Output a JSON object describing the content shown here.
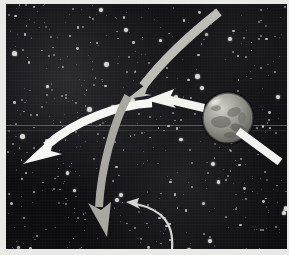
{
  "figure": {
    "kind": "astrophotograph-diagram",
    "caption_text": "",
    "background": {
      "sky_color": "#0d0d10",
      "plate_border_color": "#e9e9e6",
      "scanline_color": "#bebebe"
    },
    "planet": {
      "name": "planet-disc",
      "label": "",
      "center_x": 222,
      "center_y": 114,
      "radius": 25,
      "body_color": "#8e8e88",
      "highlight_color": "#d8d8d2",
      "shadow_color": "#4a4a46",
      "polar_cap_color": "#e2e2dc"
    },
    "annotations": [
      {
        "id": "arrow-incoming-top-right",
        "name": "arrow-curved-descending",
        "label": "",
        "color": "#bdbdb6",
        "style": "thick-curved",
        "head": "down-left",
        "from": "top-right-edge",
        "to": "center-upper"
      },
      {
        "id": "arrow-incoming-from-planet",
        "name": "arrow-pointing-left",
        "label": "",
        "color": "#f2f2ee",
        "style": "thick-straight",
        "head": "left",
        "from": "planet-left-limb",
        "to": "center"
      },
      {
        "id": "arrow-outgoing-left",
        "name": "arrow-curved-to-left-edge",
        "label": "",
        "color": "#f6f6f2",
        "style": "thick-curved",
        "head": "down-left",
        "from": "center",
        "to": "left-edge"
      },
      {
        "id": "arrow-outgoing-down",
        "name": "arrow-curved-descending-to-bottom",
        "label": "",
        "color": "#a8a8a1",
        "style": "thick-curved",
        "head": "down",
        "from": "center",
        "to": "bottom-center"
      },
      {
        "id": "arrow-trailing-right",
        "name": "arrow-band-from-planet-lower-right",
        "label": "",
        "color": "#f2f2ee",
        "style": "thick-straight-tapered",
        "head": "none",
        "from": "planet",
        "to": "right-edge-lower"
      },
      {
        "id": "pointer-thin",
        "name": "thin-pointer-arrow",
        "label": "",
        "color": "#d6d6d0",
        "style": "thin-curved",
        "head": "up-left",
        "from": "bottom-edge",
        "to": "lower-center"
      }
    ],
    "colors": {
      "accent_white": "#f6f6f2",
      "accent_gray": "#a8a8a1",
      "sky": "#0d0d10"
    }
  }
}
